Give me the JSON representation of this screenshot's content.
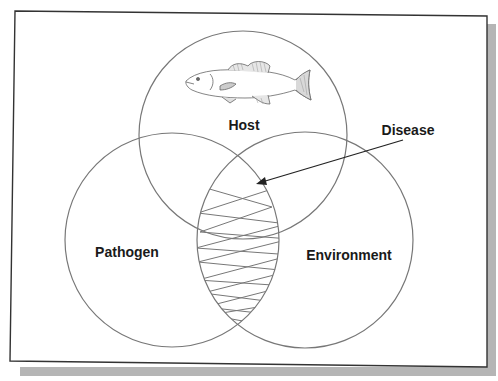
{
  "diagram": {
    "type": "venn",
    "title": "",
    "sets": [
      {
        "id": "host",
        "label": "Host",
        "illustration": "fish-icon"
      },
      {
        "id": "pathogen",
        "label": "Pathogen"
      },
      {
        "id": "environment",
        "label": "Environment"
      }
    ],
    "intersection": {
      "label": "Disease",
      "between": [
        "pathogen",
        "environment",
        "host"
      ],
      "fill": "crosshatch"
    },
    "colors": {
      "frame": "#333333",
      "shadow": "#b5b5b5",
      "circle_stroke": "#777777",
      "hatch": "#777777",
      "arrow": "#222222",
      "text": "#1a1a1a"
    }
  }
}
